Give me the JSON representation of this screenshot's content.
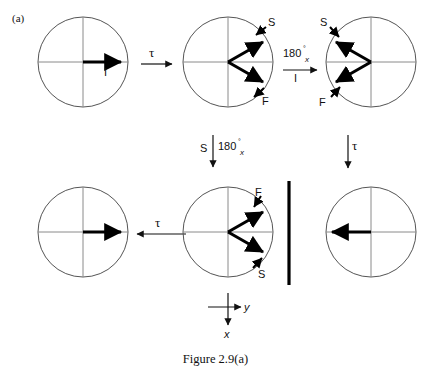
{
  "figure": {
    "panel_tag": "(a)",
    "caption": "Figure 2.9(a)",
    "axes_key": {
      "horizontal_axis_label": "y",
      "vertical_axis_label": "x"
    }
  },
  "transitions": {
    "top_left_to_mid": {
      "label": "τ",
      "direction": "right"
    },
    "top_mid_to_right": {
      "label_top": "180",
      "label_deg": "°",
      "label_sub": "x",
      "label_bottom": "I",
      "direction": "right"
    },
    "mid_down_left": {
      "label_left": "S",
      "label_top": "180",
      "label_deg": "°",
      "label_sub": "x",
      "direction": "down"
    },
    "right_down": {
      "label": "τ",
      "direction": "down"
    },
    "bottom_mid_to_left": {
      "label": "τ",
      "direction": "left"
    }
  },
  "circles": [
    {
      "id": "top-left",
      "position": "top-left",
      "vectors": [
        {
          "name": "I",
          "angle_deg": 0,
          "label": "I",
          "label_position": "below-right"
        }
      ]
    },
    {
      "id": "top-middle",
      "position": "top-middle",
      "vectors": [
        {
          "name": "S",
          "angle_deg": -30,
          "label": "S",
          "label_position": "upper-right",
          "marker": "arrow-up-right"
        },
        {
          "name": "F",
          "angle_deg": 30,
          "label": "F",
          "label_position": "lower-right",
          "marker": "arrow-down-left"
        }
      ]
    },
    {
      "id": "top-right",
      "position": "top-right",
      "vectors": [
        {
          "name": "S",
          "angle_deg": -150,
          "label": "S",
          "label_position": "upper-left",
          "marker": "arrow-down-left"
        },
        {
          "name": "F",
          "angle_deg": 150,
          "label": "F",
          "label_position": "lower-left",
          "marker": "arrow-up-left"
        }
      ]
    },
    {
      "id": "bottom-left",
      "position": "bottom-left",
      "vectors": [
        {
          "name": "I",
          "angle_deg": 0,
          "label": "",
          "label_position": "none"
        }
      ]
    },
    {
      "id": "bottom-middle",
      "position": "bottom-middle",
      "vectors": [
        {
          "name": "F",
          "angle_deg": -30,
          "label": "F",
          "label_position": "upper-right",
          "marker": "arrow-down-right"
        },
        {
          "name": "S",
          "angle_deg": 30,
          "label": "S",
          "label_position": "lower-right",
          "marker": "arrow-up-right"
        }
      ]
    },
    {
      "id": "bottom-right",
      "position": "bottom-right",
      "vectors": [
        {
          "name": "I",
          "angle_deg": 180,
          "label": "",
          "label_position": "none"
        }
      ]
    }
  ],
  "separator": {
    "type": "vertical-bar"
  },
  "colors": {
    "circle_outline": "#555555",
    "crosshair": "#8a8a8a",
    "vector": "#000000",
    "text": "#111111"
  }
}
